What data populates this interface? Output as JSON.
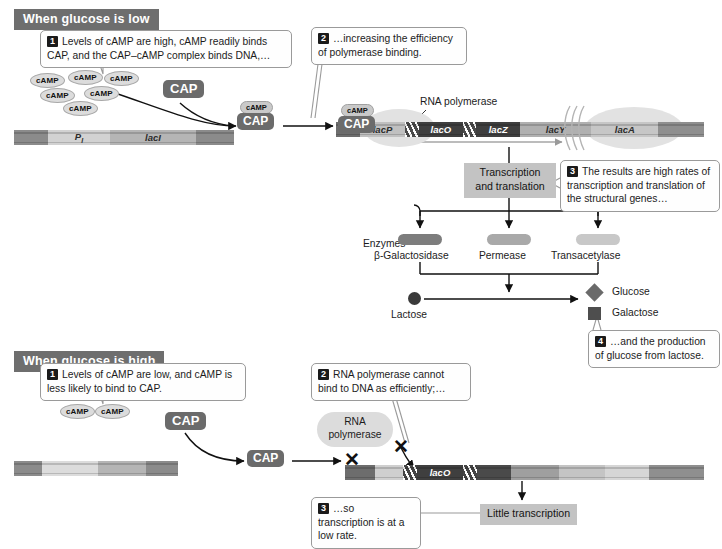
{
  "sections": {
    "low": {
      "banner": "When glucose is low",
      "callouts": [
        {
          "num": "1",
          "text": "Levels of cAMP are high, cAMP readily binds CAP, and the CAP–cAMP complex binds DNA,…"
        },
        {
          "num": "2",
          "text": "…increasing the efficiency of polymerase binding."
        },
        {
          "num": "3",
          "text": "The results are high rates of transcription and translation of the  structural genes…"
        },
        {
          "num": "4",
          "text": "…and the production of glucose from lactose."
        }
      ],
      "camp_label": "cAMP",
      "camp_count": 6,
      "cap_label": "CAP",
      "complex": {
        "top": "cAMP",
        "bottom": "CAP"
      },
      "regulatory_dna": {
        "promoter": "P",
        "promoter_sub": "I",
        "gene": "lacI"
      },
      "operon_dna": [
        {
          "label": "lacP",
          "tone": "light"
        },
        {
          "label": "lacO",
          "tone": "dark"
        },
        {
          "label": "lacZ",
          "tone": "dark"
        },
        {
          "label": "lacY",
          "tone": "light"
        },
        {
          "label": "lacA",
          "tone": "light"
        }
      ],
      "polymerase_label": "RNA polymerase",
      "process_box": "Transcription\nand translation",
      "process_line1": "Transcription",
      "process_line2": "and translation",
      "enzymes_label": "Enzymes",
      "enzymes": [
        {
          "name": "β-Galactosidase",
          "color": "#7d7d7d"
        },
        {
          "name": "Permease",
          "color": "#a9a9a9"
        },
        {
          "name": "Transacetylase",
          "color": "#c8c8c8"
        }
      ],
      "lactose_label": "Lactose",
      "products": [
        {
          "name": "Glucose",
          "shape": "diamond",
          "color": "#6a6a6a"
        },
        {
          "name": "Galactose",
          "shape": "square",
          "color": "#4e4e4e"
        }
      ]
    },
    "high": {
      "banner": "When glucose is high",
      "callouts": [
        {
          "num": "1",
          "text": "Levels of cAMP are low, and cAMP is less likely to bind to CAP."
        },
        {
          "num": "2",
          "text": "RNA polymerase cannot bind to DNA as efficiently;…"
        },
        {
          "num": "3",
          "text": "…so transcription is at a low rate."
        }
      ],
      "camp_label": "cAMP",
      "camp_count": 2,
      "cap_label": "CAP",
      "polymerase_line1": "RNA",
      "polymerase_line2": "polymerase",
      "operon_dna": [
        {
          "label": "lacO",
          "tone": "dark"
        }
      ],
      "x_marks": 2,
      "result_box": "Little transcription"
    }
  },
  "colors": {
    "banner_bg": "#6e6e6e",
    "cap_bg": "#6b6b6b",
    "camp_bg": "#dcdcdc",
    "process_box_bg": "#c3c3c3",
    "dna_dark": "#6d6d6d",
    "dna_mid": "#9f9f9f",
    "dna_light": "#d8d8d8",
    "text": "#1a1a1a"
  }
}
